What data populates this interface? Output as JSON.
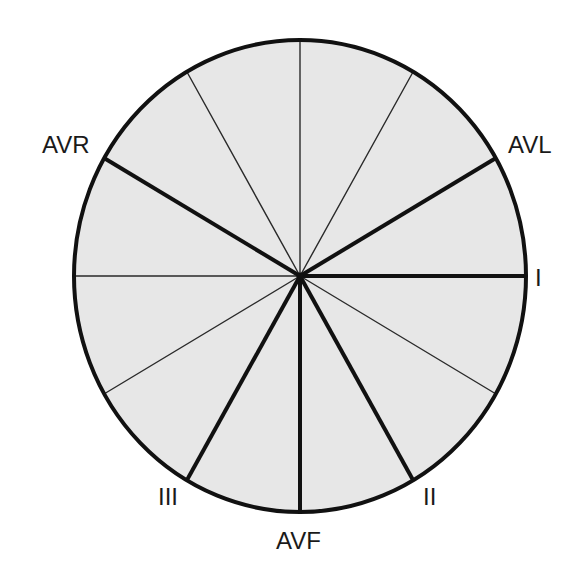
{
  "diagram": {
    "center": {
      "x": 300,
      "y": 276
    },
    "radius": {
      "rx": 226,
      "ry": 236
    },
    "colors": {
      "fill": "#e7e7e7",
      "stroke": "#111111",
      "background": "#ffffff"
    },
    "primary_leads": [
      {
        "label": "I",
        "angle": 0
      },
      {
        "label": "II",
        "angle": 60
      },
      {
        "label": "AVF",
        "angle": 90
      },
      {
        "label": "III",
        "angle": 120
      },
      {
        "label": "AVR",
        "angle": -150
      },
      {
        "label": "AVL",
        "angle": -30
      }
    ],
    "secondary_axes_angles": [
      -90,
      -60,
      -120,
      180,
      30,
      150
    ],
    "labels": {
      "avr": "AVR",
      "avl": "AVL",
      "i": "I",
      "ii": "II",
      "iii": "III",
      "avf": "AVF"
    }
  }
}
